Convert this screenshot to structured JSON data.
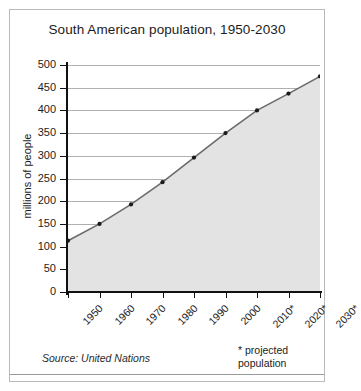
{
  "chart_data": {
    "type": "area",
    "title": "South American population, 1950-2030",
    "xlabel": "",
    "ylabel": "millions of people",
    "categories": [
      "1950",
      "1960",
      "1970",
      "1980",
      "1990",
      "2000",
      "2010*",
      "2020*",
      "2030*"
    ],
    "values": [
      113,
      150,
      193,
      242,
      296,
      350,
      400,
      437,
      475
    ],
    "ylim": [
      0,
      500
    ],
    "ytick_labels": [
      "0",
      "50",
      "100",
      "150",
      "200",
      "250",
      "300",
      "350",
      "400",
      "450",
      "500"
    ],
    "ytick_values": [
      0,
      50,
      100,
      150,
      200,
      250,
      300,
      350,
      400,
      450,
      500
    ],
    "grid": true,
    "legend": "none",
    "series": [
      {
        "name": "South American population",
        "values": [
          113,
          150,
          193,
          242,
          296,
          350,
          400,
          437,
          475
        ]
      }
    ],
    "annotations": {
      "source": "Source: United Nations",
      "projected_note_line1": "* projected",
      "projected_note_line2": "population"
    },
    "colors": {
      "fill": "#e3e3e3",
      "line": "#6b6b6b",
      "marker": "#1a1a1a",
      "grid": "#b0b0b0",
      "axis": "#111111",
      "text": "#1c1c1c",
      "frame": "#b9b9b9",
      "background": "#ffffff"
    }
  }
}
